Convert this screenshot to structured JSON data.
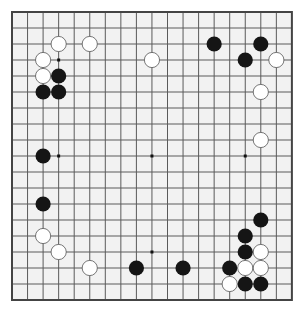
{
  "board": {
    "size": 19,
    "origin_x": 12,
    "origin_y": 12,
    "spacing_x": 15.55,
    "spacing_y": 16,
    "background_color": "#f2f2f2",
    "line_color": "#5a5a5a",
    "border_color": "#444444",
    "star_points": [
      [
        3,
        3
      ],
      [
        9,
        3
      ],
      [
        15,
        3
      ],
      [
        3,
        9
      ],
      [
        9,
        9
      ],
      [
        15,
        9
      ],
      [
        3,
        15
      ],
      [
        9,
        15
      ],
      [
        15,
        15
      ]
    ]
  },
  "stones": {
    "black_color": "#151515",
    "white_color": "#ffffff",
    "white_outline": "#555555",
    "black": [
      [
        13,
        2
      ],
      [
        16,
        2
      ],
      [
        15,
        3
      ],
      [
        3,
        4
      ],
      [
        2,
        5
      ],
      [
        3,
        5
      ],
      [
        2,
        9
      ],
      [
        2,
        12
      ],
      [
        16,
        13
      ],
      [
        15,
        14
      ],
      [
        15,
        15
      ],
      [
        8,
        16
      ],
      [
        11,
        16
      ],
      [
        14,
        16
      ],
      [
        15,
        17
      ],
      [
        16,
        17
      ]
    ],
    "white": [
      [
        3,
        2
      ],
      [
        5,
        2
      ],
      [
        9,
        3
      ],
      [
        17,
        3
      ],
      [
        2,
        3
      ],
      [
        2,
        4
      ],
      [
        16,
        5
      ],
      [
        16,
        8
      ],
      [
        2,
        14
      ],
      [
        3,
        15
      ],
      [
        5,
        16
      ],
      [
        16,
        15
      ],
      [
        15,
        16
      ],
      [
        16,
        16
      ],
      [
        14,
        17
      ]
    ]
  }
}
